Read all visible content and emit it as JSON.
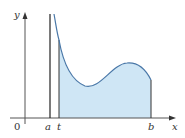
{
  "figure": {
    "labels": {
      "y_axis": "y",
      "x_axis": "x",
      "origin": "0",
      "a": "a",
      "t": "t",
      "b": "b"
    },
    "colors": {
      "axis": "#555555",
      "curve": "#4a78a8",
      "fill": "#cfe6f5",
      "vertical_a": "#222222",
      "vertical_t": "#333333",
      "text": "#333333"
    }
  }
}
